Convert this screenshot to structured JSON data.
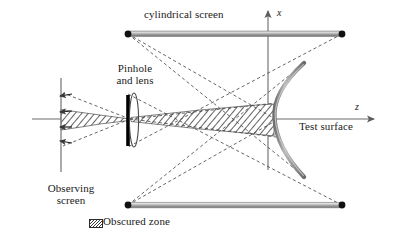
{
  "figure": {
    "labels": {
      "cylindrical_screen": "cylindrical screen",
      "pinhole_and_lens": "Pinhole\nand lens",
      "pinhole_line1": "Pinhole",
      "pinhole_line2": "and lens",
      "observing_screen_line1": "Observing",
      "observing_screen_line2": "screen",
      "test_surface": "Test surface",
      "axis_x": "x",
      "axis_z": "z",
      "obscured_zone": "Obscured zone"
    },
    "colors": {
      "screen_bar_light": "#d7d7d7",
      "screen_bar_mid": "#9a9a9a",
      "screen_bar_dark": "#6e6e6e",
      "axis": "#6b6b6b",
      "ray_dash": "#4a4a4a",
      "endpoint_dot": "#111111",
      "pinhole": "#000000",
      "lens_outline": "#4a4a4a",
      "hatch": "#2f2f2f",
      "text": "#1a1a1a",
      "background": "#ffffff"
    },
    "geometry": {
      "cylindrical_screen_top": {
        "x1": 128,
        "y1": 34,
        "x2": 342,
        "y2": 34
      },
      "cylindrical_screen_bottom": {
        "x1": 128,
        "y1": 205,
        "x2": 342,
        "y2": 205
      },
      "observing_screen": {
        "x": 61,
        "y1": 78,
        "y2": 172
      },
      "pinhole": {
        "x": 128,
        "y1": 95,
        "y2": 146
      },
      "lens": {
        "cx": 134,
        "cy": 120,
        "rx": 4.5,
        "ry": 27
      },
      "optical_axis_y": 119,
      "x_axis_x": 268,
      "test_surface_vertex": {
        "x": 275,
        "y": 119
      },
      "test_surface_top": {
        "x": 303,
        "y": 64
      },
      "test_surface_bottom": {
        "x": 303,
        "y": 176
      },
      "z_arrow_tip": {
        "x": 374,
        "y": 119
      },
      "x_arrow_tip": {
        "x": 268,
        "y": 10
      }
    },
    "arrow_marks_on_observing_screen": [
      {
        "x": 61,
        "y": 96
      },
      {
        "x": 61,
        "y": 112
      },
      {
        "x": 61,
        "y": 127
      },
      {
        "x": 61,
        "y": 141
      }
    ],
    "endpoint_dots": [
      {
        "x": 128,
        "y": 34
      },
      {
        "x": 342,
        "y": 34
      },
      {
        "x": 128,
        "y": 205
      },
      {
        "x": 342,
        "y": 205
      }
    ],
    "rays": [
      {
        "from": "top-left-screen-end",
        "x1": 128,
        "y1": 34,
        "x2": 303,
        "y2": 176
      },
      {
        "from": "top-left-screen-end",
        "x1": 128,
        "y1": 34,
        "x2": 275,
        "y2": 119
      },
      {
        "from": "top-right-screen-end",
        "x1": 342,
        "y1": 34,
        "x2": 128,
        "y2": 146
      },
      {
        "from": "bottom-left-screen-end",
        "x1": 128,
        "y1": 205,
        "x2": 303,
        "y2": 64
      },
      {
        "from": "bottom-left-screen-end",
        "x1": 128,
        "y1": 205,
        "x2": 275,
        "y2": 119
      },
      {
        "from": "bottom-right-screen-end",
        "x1": 342,
        "y1": 205,
        "x2": 128,
        "y2": 95
      },
      {
        "from": "pinhole",
        "x1": 130,
        "y1": 120,
        "x2": 275,
        "y2": 104
      },
      {
        "from": "pinhole",
        "x1": 130,
        "y1": 120,
        "x2": 275,
        "y2": 136
      },
      {
        "from": "pinhole-left",
        "x1": 130,
        "y1": 120,
        "x2": 61,
        "y2": 93
      },
      {
        "from": "pinhole-left",
        "x1": 130,
        "y1": 120,
        "x2": 61,
        "y2": 146
      }
    ],
    "obscured_zones": [
      {
        "name": "right-wedge",
        "points": "131,118 275,104 275,136 131,122"
      },
      {
        "name": "left-wedge",
        "points": "129,119 61,110 61,130 129,121"
      }
    ]
  }
}
